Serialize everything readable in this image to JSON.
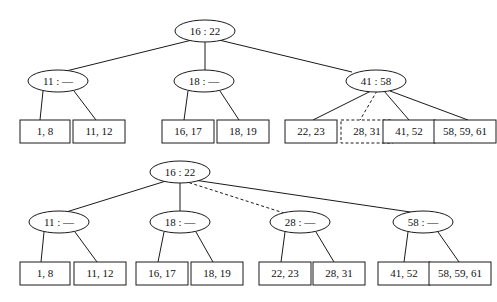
{
  "figure": {
    "background_color": "#ffffff",
    "line_color": "#1a1a1a",
    "text_color": "#111111"
  },
  "trees": [
    {
      "id": "top-tree",
      "name": "before-split-tree",
      "root": {
        "label": "16 : 22"
      },
      "internal_nodes": [
        {
          "label": "11 : —"
        },
        {
          "label": "18 : —"
        },
        {
          "label": "41 : 58"
        }
      ],
      "leaves": [
        {
          "label": "1, 8",
          "style": "solid"
        },
        {
          "label": "11, 12",
          "style": "solid"
        },
        {
          "label": "16, 17",
          "style": "solid"
        },
        {
          "label": "18, 19",
          "style": "solid"
        },
        {
          "label": "22, 23",
          "style": "solid"
        },
        {
          "label": "28, 31",
          "style": "dashed"
        },
        {
          "label": "41, 52",
          "style": "solid"
        },
        {
          "label": "58, 59, 61",
          "style": "solid"
        }
      ]
    },
    {
      "id": "bottom-tree",
      "name": "after-split-tree",
      "root": {
        "label": "16 : 22"
      },
      "internal_nodes": [
        {
          "label": "11 : —"
        },
        {
          "label": "18 : —"
        },
        {
          "label": "28 : —"
        },
        {
          "label": "58 : —"
        }
      ],
      "leaves": [
        {
          "label": "1, 8",
          "style": "solid"
        },
        {
          "label": "11, 12",
          "style": "solid"
        },
        {
          "label": "16, 17",
          "style": "solid"
        },
        {
          "label": "18, 19",
          "style": "solid"
        },
        {
          "label": "22, 23",
          "style": "solid"
        },
        {
          "label": "28, 31",
          "style": "solid"
        },
        {
          "label": "41, 52",
          "style": "solid"
        },
        {
          "label": "58, 59, 61",
          "style": "solid"
        }
      ]
    }
  ]
}
